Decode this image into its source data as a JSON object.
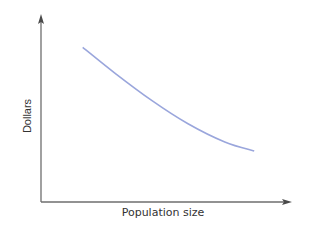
{
  "chart_data": {
    "type": "line",
    "title": "",
    "xlabel": "Population size",
    "ylabel": "Dollars",
    "xlim": [
      0,
      1
    ],
    "ylim": [
      0,
      1
    ],
    "grid": false,
    "legend": "none",
    "x_ticks": [],
    "y_ticks": [],
    "series": [
      {
        "name": "cost curve",
        "color": "#9aa6dc",
        "x": [
          0.17,
          0.3,
          0.45,
          0.6,
          0.75,
          0.87
        ],
        "y": [
          0.85,
          0.71,
          0.56,
          0.43,
          0.33,
          0.28
        ]
      }
    ]
  }
}
